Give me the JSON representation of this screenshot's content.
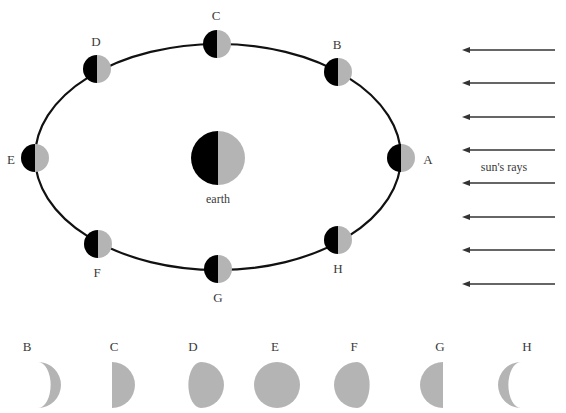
{
  "diagram": {
    "colors": {
      "dark_side": "#000000",
      "lit_side": "#b4b4b4",
      "phase_fill": "#b4b4b4",
      "orbit": "#111111",
      "arrow": "#333333",
      "text": "#3a3a3a"
    },
    "earth": {
      "label": "earth",
      "cx": 218,
      "cy": 158,
      "r": 27
    },
    "orbit": {
      "cx": 218,
      "cy": 157,
      "rx": 183,
      "ry": 113
    },
    "moons": [
      {
        "id": "A",
        "label": "A",
        "cx": 401,
        "cy": 158,
        "label_x": 428,
        "label_y": 159
      },
      {
        "id": "B",
        "label": "B",
        "cx": 338,
        "cy": 72,
        "label_x": 337,
        "label_y": 44
      },
      {
        "id": "C",
        "label": "C",
        "cx": 217,
        "cy": 44,
        "label_x": 216,
        "label_y": 15
      },
      {
        "id": "D",
        "label": "D",
        "cx": 97,
        "cy": 69,
        "label_x": 96,
        "label_y": 41
      },
      {
        "id": "E",
        "label": "E",
        "cx": 35,
        "cy": 158,
        "label_x": 11,
        "label_y": 159
      },
      {
        "id": "F",
        "label": "F",
        "cx": 98,
        "cy": 244,
        "label_x": 97,
        "label_y": 272
      },
      {
        "id": "G",
        "label": "G",
        "cx": 218,
        "cy": 269,
        "label_x": 218,
        "label_y": 297
      },
      {
        "id": "H",
        "label": "H",
        "cx": 338,
        "cy": 240,
        "label_x": 338,
        "label_y": 268
      }
    ],
    "moon_radius": 14,
    "sun_rays": {
      "label": "sun's rays",
      "label_x": 504,
      "label_y": 167,
      "x_start": 555,
      "x_end": 462,
      "y_values": [
        50,
        83,
        117,
        150,
        183,
        217,
        250,
        284
      ]
    },
    "phases": [
      {
        "id": "B",
        "label": "B",
        "type": "waning-crescent-right",
        "label_x": 27,
        "cx": 38
      },
      {
        "id": "C",
        "label": "C",
        "type": "half-right",
        "label_x": 114,
        "cx": 112
      },
      {
        "id": "D",
        "label": "D",
        "type": "gibbous-right",
        "label_x": 193,
        "cx": 201
      },
      {
        "id": "E",
        "label": "E",
        "type": "full",
        "label_x": 275,
        "cx": 277
      },
      {
        "id": "F",
        "label": "F",
        "type": "gibbous-left",
        "label_x": 354,
        "cx": 357
      },
      {
        "id": "G",
        "label": "G",
        "type": "half-left",
        "label_x": 440,
        "cx": 443
      },
      {
        "id": "H",
        "label": "H",
        "type": "crescent-left",
        "label_x": 527,
        "cx": 521
      }
    ],
    "phase_row": {
      "label_y": 346,
      "cy": 385,
      "r": 23
    }
  }
}
